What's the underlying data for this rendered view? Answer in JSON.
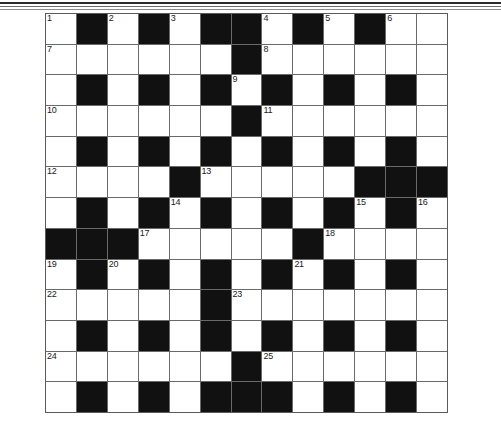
{
  "page": {
    "background_color": "#ffffff",
    "decorative_rules": [
      "rule-thick-dark",
      "rule-medium-gray",
      "rule-thin-gray"
    ]
  },
  "crossword": {
    "name": "crossword-grid",
    "columns": 13,
    "rows": 13,
    "white_color": "#ffffff",
    "black_color": "#111111",
    "grid_line_color": "#6a6a6a",
    "number_color": "#1a1a1a",
    "max_clue_number": 25,
    "cells": [
      [
        {
          "type": "white",
          "number": "1"
        },
        {
          "type": "black"
        },
        {
          "type": "white",
          "number": "2"
        },
        {
          "type": "black"
        },
        {
          "type": "white",
          "number": "3"
        },
        {
          "type": "black"
        },
        {
          "type": "black"
        },
        {
          "type": "white",
          "number": "4"
        },
        {
          "type": "black"
        },
        {
          "type": "white",
          "number": "5"
        },
        {
          "type": "black"
        },
        {
          "type": "white",
          "number": "6"
        },
        {
          "type": "white"
        }
      ],
      [
        {
          "type": "white",
          "number": "7"
        },
        {
          "type": "white"
        },
        {
          "type": "white"
        },
        {
          "type": "white"
        },
        {
          "type": "white"
        },
        {
          "type": "white"
        },
        {
          "type": "black"
        },
        {
          "type": "white",
          "number": "8"
        },
        {
          "type": "white"
        },
        {
          "type": "white"
        },
        {
          "type": "white"
        },
        {
          "type": "white"
        },
        {
          "type": "white"
        }
      ],
      [
        {
          "type": "white"
        },
        {
          "type": "black"
        },
        {
          "type": "white"
        },
        {
          "type": "black"
        },
        {
          "type": "white"
        },
        {
          "type": "black"
        },
        {
          "type": "white",
          "number": "9"
        },
        {
          "type": "black"
        },
        {
          "type": "white"
        },
        {
          "type": "black"
        },
        {
          "type": "white"
        },
        {
          "type": "black"
        },
        {
          "type": "white"
        }
      ],
      [
        {
          "type": "white",
          "number": "10"
        },
        {
          "type": "white"
        },
        {
          "type": "white"
        },
        {
          "type": "white"
        },
        {
          "type": "white"
        },
        {
          "type": "white"
        },
        {
          "type": "black"
        },
        {
          "type": "white",
          "number": "11"
        },
        {
          "type": "white"
        },
        {
          "type": "white"
        },
        {
          "type": "white"
        },
        {
          "type": "white"
        },
        {
          "type": "white"
        }
      ],
      [
        {
          "type": "white"
        },
        {
          "type": "black"
        },
        {
          "type": "white"
        },
        {
          "type": "black"
        },
        {
          "type": "white"
        },
        {
          "type": "black"
        },
        {
          "type": "white"
        },
        {
          "type": "black"
        },
        {
          "type": "white"
        },
        {
          "type": "black"
        },
        {
          "type": "white"
        },
        {
          "type": "black"
        },
        {
          "type": "white"
        }
      ],
      [
        {
          "type": "white",
          "number": "12"
        },
        {
          "type": "white"
        },
        {
          "type": "white"
        },
        {
          "type": "white"
        },
        {
          "type": "black"
        },
        {
          "type": "white",
          "number": "13"
        },
        {
          "type": "white"
        },
        {
          "type": "white"
        },
        {
          "type": "white"
        },
        {
          "type": "white"
        },
        {
          "type": "black"
        },
        {
          "type": "black"
        },
        {
          "type": "black"
        }
      ],
      [
        {
          "type": "white"
        },
        {
          "type": "black"
        },
        {
          "type": "white"
        },
        {
          "type": "black"
        },
        {
          "type": "white",
          "number": "14"
        },
        {
          "type": "black"
        },
        {
          "type": "white"
        },
        {
          "type": "black"
        },
        {
          "type": "white"
        },
        {
          "type": "black"
        },
        {
          "type": "white",
          "number": "15"
        },
        {
          "type": "black"
        },
        {
          "type": "white",
          "number": "16"
        }
      ],
      [
        {
          "type": "black"
        },
        {
          "type": "black"
        },
        {
          "type": "black"
        },
        {
          "type": "white",
          "number": "17"
        },
        {
          "type": "white"
        },
        {
          "type": "white"
        },
        {
          "type": "white"
        },
        {
          "type": "white"
        },
        {
          "type": "black"
        },
        {
          "type": "white",
          "number": "18"
        },
        {
          "type": "white"
        },
        {
          "type": "white"
        },
        {
          "type": "white"
        }
      ],
      [
        {
          "type": "white",
          "number": "19"
        },
        {
          "type": "black"
        },
        {
          "type": "white",
          "number": "20"
        },
        {
          "type": "black"
        },
        {
          "type": "white"
        },
        {
          "type": "black"
        },
        {
          "type": "white"
        },
        {
          "type": "black"
        },
        {
          "type": "white",
          "number": "21"
        },
        {
          "type": "black"
        },
        {
          "type": "white"
        },
        {
          "type": "black"
        },
        {
          "type": "white"
        }
      ],
      [
        {
          "type": "white",
          "number": "22"
        },
        {
          "type": "white"
        },
        {
          "type": "white"
        },
        {
          "type": "white"
        },
        {
          "type": "white"
        },
        {
          "type": "black"
        },
        {
          "type": "white",
          "number": "23"
        },
        {
          "type": "white"
        },
        {
          "type": "white"
        },
        {
          "type": "white"
        },
        {
          "type": "white"
        },
        {
          "type": "white"
        },
        {
          "type": "white"
        }
      ],
      [
        {
          "type": "white"
        },
        {
          "type": "black"
        },
        {
          "type": "white"
        },
        {
          "type": "black"
        },
        {
          "type": "white"
        },
        {
          "type": "black"
        },
        {
          "type": "white"
        },
        {
          "type": "black"
        },
        {
          "type": "white"
        },
        {
          "type": "black"
        },
        {
          "type": "white"
        },
        {
          "type": "black"
        },
        {
          "type": "white"
        }
      ],
      [
        {
          "type": "white",
          "number": "24"
        },
        {
          "type": "white"
        },
        {
          "type": "white"
        },
        {
          "type": "white"
        },
        {
          "type": "white"
        },
        {
          "type": "white"
        },
        {
          "type": "black"
        },
        {
          "type": "white",
          "number": "25"
        },
        {
          "type": "white"
        },
        {
          "type": "white"
        },
        {
          "type": "white"
        },
        {
          "type": "white"
        },
        {
          "type": "white"
        }
      ],
      [
        {
          "type": "white"
        },
        {
          "type": "black"
        },
        {
          "type": "white"
        },
        {
          "type": "black"
        },
        {
          "type": "white"
        },
        {
          "type": "black"
        },
        {
          "type": "black"
        },
        {
          "type": "black"
        },
        {
          "type": "white"
        },
        {
          "type": "black"
        },
        {
          "type": "white"
        },
        {
          "type": "black"
        },
        {
          "type": "white"
        }
      ]
    ]
  }
}
